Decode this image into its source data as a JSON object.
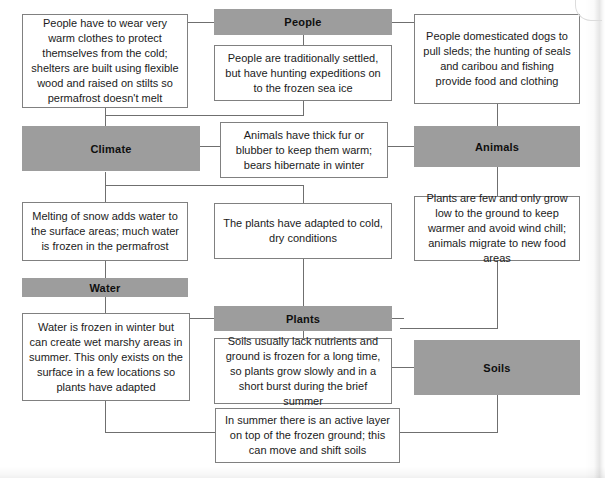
{
  "diagram": {
    "colors": {
      "header_fill": "#9d9d9d",
      "box_border": "#808080",
      "connector": "#6f6f6f",
      "page_background": "#ffffff",
      "text": "#1b1b1b"
    },
    "headers": [
      {
        "id": "people",
        "label": "People"
      },
      {
        "id": "climate",
        "label": "Climate"
      },
      {
        "id": "animals",
        "label": "Animals"
      },
      {
        "id": "water",
        "label": "Water"
      },
      {
        "id": "plants",
        "label": "Plants"
      },
      {
        "id": "soils",
        "label": "Soils"
      }
    ],
    "descriptions": [
      {
        "id": "people-clothing",
        "text": "People have to wear very warm clothes to protect themselves from the cold; shelters are built using flexible wood and raised on stilts so permafrost doesn't melt"
      },
      {
        "id": "people-settlement",
        "text": "People are traditionally settled, but have hunting expeditions on to the frozen sea ice"
      },
      {
        "id": "people-dogs",
        "text": "People domesticated dogs to pull sleds; the hunting of seals and caribou and fishing provide food and clothing"
      },
      {
        "id": "animals-fur",
        "text": "Animals have thick fur or blubber to keep them warm; bears hibernate in winter"
      },
      {
        "id": "water-melting",
        "text": "Melting of snow adds water to the surface areas; much water is frozen in the permafrost"
      },
      {
        "id": "plants-adapted",
        "text": "The plants have adapted to cold, dry conditions"
      },
      {
        "id": "plants-low",
        "text": "Plants are few and only grow low to the ground to keep warmer and avoid wind chill; animals migrate to new food areas"
      },
      {
        "id": "water-frozen",
        "text": "Water is frozen in winter but can create wet marshy areas in summer. This only exists on the surface in a few locations so plants have adapted"
      },
      {
        "id": "soils-nutrients",
        "text": "Soils usually lack nutrients and ground is frozen for a long time, so plants grow slowly and in a short burst during the brief summer"
      },
      {
        "id": "soils-active-layer",
        "text": "In summer there is an active layer on top of the frozen ground; this can move and shift soils"
      }
    ]
  }
}
